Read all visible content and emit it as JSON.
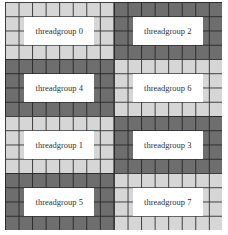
{
  "diagram": {
    "grid": {
      "columns": 16,
      "rows": 16
    },
    "threadgroup_layout": {
      "columns": 2,
      "rows": 4,
      "cells_per_group": "8x4"
    },
    "colors": {
      "light": "#d6d6d6",
      "dark": "#6e6e6e",
      "label_bg": "#ffffff"
    },
    "threadgroups": [
      {
        "label": "threadgroup 0",
        "shade": "light"
      },
      {
        "label": "threadgroup 2",
        "shade": "dark"
      },
      {
        "label": "threadgroup 4",
        "shade": "dark"
      },
      {
        "label": "threadgroup 6",
        "shade": "light"
      },
      {
        "label": "threadgroup 1",
        "shade": "light"
      },
      {
        "label": "threadgroup 3",
        "shade": "dark"
      },
      {
        "label": "threadgroup 5",
        "shade": "dark"
      },
      {
        "label": "threadgroup 7",
        "shade": "light"
      }
    ]
  }
}
